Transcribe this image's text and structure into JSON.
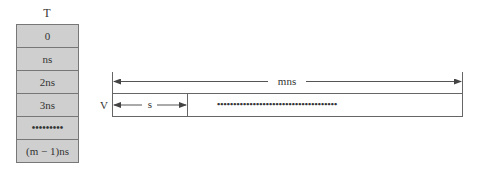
{
  "table": {
    "title": "T",
    "cells": [
      "0",
      "ns",
      "2ns",
      "3ns",
      "•••••••••",
      "(m − 1)ns"
    ]
  },
  "diagram": {
    "row_label": "V",
    "total_span_label": "mns",
    "first_slot_label": "s",
    "remaining_slots": "•••••••••••••••••••••••••••••••••••••"
  }
}
